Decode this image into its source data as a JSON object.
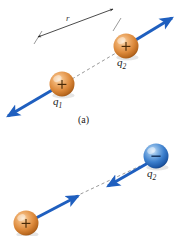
{
  "figure": {
    "background_color": "#ffffff",
    "width": 181,
    "height": 236,
    "panels": [
      {
        "id": "panel-a",
        "caption": "(a)",
        "description": "Two like (positive) point charges repel each other",
        "interaction": "repulsion",
        "distance_label": "r",
        "charges": [
          {
            "name": "q1",
            "label": "q",
            "subscript": "1",
            "sign_glyph": "+",
            "polarity": "positive",
            "color": "#d98033",
            "color_light": "#f6c48a",
            "color_dark": "#a45a18",
            "cx": 62,
            "cy": 84,
            "r": 12.5
          },
          {
            "name": "q2",
            "label": "q",
            "subscript": "2",
            "sign_glyph": "+",
            "polarity": "positive",
            "color": "#d98033",
            "color_light": "#f6c48a",
            "color_dark": "#a45a18",
            "cx": 126,
            "cy": 46,
            "r": 12.5
          }
        ],
        "force_arrows": [
          {
            "name": "force-on-q1",
            "direction": "down-left",
            "color": "#1f5fbf"
          },
          {
            "name": "force-on-q2",
            "direction": "up-right",
            "color": "#1f5fbf"
          }
        ],
        "connector": {
          "name": "separation-dashed-line",
          "style": "dashed",
          "color": "#9a9a9a"
        }
      },
      {
        "id": "panel-b",
        "caption": "",
        "description": "Two unlike charges (positive and negative) attract each other",
        "interaction": "attraction",
        "distance_label": "",
        "charges": [
          {
            "name": "q1",
            "label": "",
            "subscript": "",
            "sign_glyph": "+",
            "polarity": "positive",
            "color": "#d98033",
            "color_light": "#f6c48a",
            "color_dark": "#a45a18",
            "cx": 26,
            "cy": 223,
            "r": 12.5
          },
          {
            "name": "q2",
            "label": "q",
            "subscript": "2",
            "sign_glyph": "–",
            "polarity": "negative",
            "color": "#2f6fc4",
            "color_light": "#9ec4ea",
            "color_dark": "#15407f",
            "cx": 156,
            "cy": 156,
            "r": 12.5
          }
        ],
        "force_arrows": [
          {
            "name": "force-on-q1",
            "direction": "up-right",
            "color": "#1f5fbf"
          },
          {
            "name": "force-on-q2",
            "direction": "down-left",
            "color": "#1f5fbf"
          }
        ],
        "connector": {
          "name": "separation-dashed-line",
          "style": "dashed",
          "color": "#9a9a9a"
        }
      }
    ],
    "labels": {
      "panel_a_q1": "q",
      "panel_a_q1_sub": "1",
      "panel_a_q2": "q",
      "panel_a_q2_sub": "2",
      "panel_a_distance": "r",
      "panel_a_caption": "(a)",
      "panel_b_q2": "q",
      "panel_b_q2_sub": "2",
      "sign_positive": "+",
      "sign_negative": "–"
    }
  }
}
